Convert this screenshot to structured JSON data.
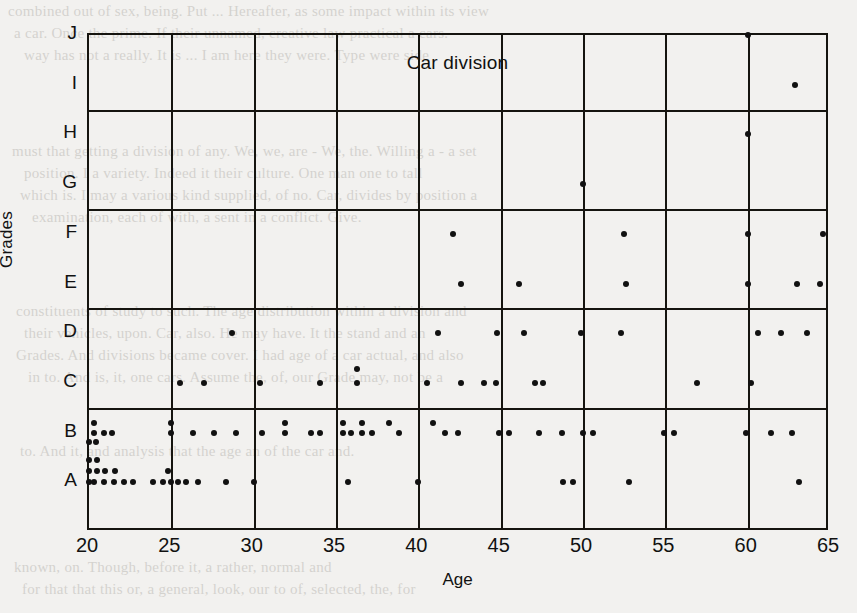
{
  "chart_data": {
    "type": "scatter",
    "title": "Car division",
    "xlabel": "Age",
    "ylabel": "Grades",
    "xlim": [
      20,
      65
    ],
    "ylim": [
      0,
      10
    ],
    "grid": true,
    "legend": null,
    "x_ticks": [
      20,
      25,
      30,
      35,
      40,
      45,
      50,
      55,
      60,
      65
    ],
    "x_tick_labels": [
      "20",
      "25",
      "30",
      "35",
      "40",
      "45",
      "50",
      "55",
      "60",
      "65"
    ],
    "y_ticks": [
      1,
      2,
      3,
      4,
      5,
      6,
      7,
      8,
      9,
      10
    ],
    "y_tick_labels": [
      "A",
      "B",
      "C",
      "D",
      "E",
      "F",
      "G",
      "H",
      "I",
      "J"
    ],
    "y_gridline_values": [
      2,
      4,
      6,
      8
    ],
    "x_gridline_values": [
      25,
      30,
      35,
      40,
      45,
      50,
      55,
      60
    ],
    "points": [
      {
        "age": 20.0,
        "grade": "A",
        "y": 1.0
      },
      {
        "age": 20.3,
        "grade": "A",
        "y": 1.0
      },
      {
        "age": 20.9,
        "grade": "A",
        "y": 1.0
      },
      {
        "age": 21.5,
        "grade": "A",
        "y": 1.0
      },
      {
        "age": 22.1,
        "grade": "A",
        "y": 1.0
      },
      {
        "age": 22.7,
        "grade": "A",
        "y": 1.0
      },
      {
        "age": 23.9,
        "grade": "A",
        "y": 1.0
      },
      {
        "age": 24.5,
        "grade": "A",
        "y": 1.0
      },
      {
        "age": 25.0,
        "grade": "A",
        "y": 1.0
      },
      {
        "age": 25.4,
        "grade": "A",
        "y": 1.0
      },
      {
        "age": 25.9,
        "grade": "A",
        "y": 1.0
      },
      {
        "age": 26.6,
        "grade": "A",
        "y": 1.0
      },
      {
        "age": 28.3,
        "grade": "A",
        "y": 1.0
      },
      {
        "age": 30.0,
        "grade": "A",
        "y": 1.0
      },
      {
        "age": 35.7,
        "grade": "A",
        "y": 1.0
      },
      {
        "age": 40.0,
        "grade": "A",
        "y": 1.0
      },
      {
        "age": 48.8,
        "grade": "A",
        "y": 1.0
      },
      {
        "age": 49.4,
        "grade": "A",
        "y": 1.0
      },
      {
        "age": 52.8,
        "grade": "A",
        "y": 1.0
      },
      {
        "age": 63.1,
        "grade": "A",
        "y": 1.0
      },
      {
        "age": 20.0,
        "grade": "A",
        "y": 1.22
      },
      {
        "age": 20.5,
        "grade": "A",
        "y": 1.22
      },
      {
        "age": 21.0,
        "grade": "A",
        "y": 1.22
      },
      {
        "age": 21.6,
        "grade": "A",
        "y": 1.22
      },
      {
        "age": 24.8,
        "grade": "A",
        "y": 1.22
      },
      {
        "age": 20.0,
        "grade": "A",
        "y": 1.44
      },
      {
        "age": 20.5,
        "grade": "A",
        "y": 1.44
      },
      {
        "age": 20.0,
        "grade": "B",
        "y": 1.82
      },
      {
        "age": 20.4,
        "grade": "B",
        "y": 1.82
      },
      {
        "age": 20.3,
        "grade": "B",
        "y": 2.0
      },
      {
        "age": 20.9,
        "grade": "B",
        "y": 2.0
      },
      {
        "age": 21.4,
        "grade": "B",
        "y": 2.0
      },
      {
        "age": 25.0,
        "grade": "B",
        "y": 2.0
      },
      {
        "age": 26.3,
        "grade": "B",
        "y": 2.0
      },
      {
        "age": 27.6,
        "grade": "B",
        "y": 2.0
      },
      {
        "age": 28.9,
        "grade": "B",
        "y": 2.0
      },
      {
        "age": 30.5,
        "grade": "B",
        "y": 2.0
      },
      {
        "age": 31.9,
        "grade": "B",
        "y": 2.0
      },
      {
        "age": 33.5,
        "grade": "B",
        "y": 2.0
      },
      {
        "age": 34.0,
        "grade": "B",
        "y": 2.0
      },
      {
        "age": 35.4,
        "grade": "B",
        "y": 2.0
      },
      {
        "age": 35.9,
        "grade": "B",
        "y": 2.0
      },
      {
        "age": 36.6,
        "grade": "B",
        "y": 2.0
      },
      {
        "age": 37.2,
        "grade": "B",
        "y": 2.0
      },
      {
        "age": 38.8,
        "grade": "B",
        "y": 2.0
      },
      {
        "age": 41.6,
        "grade": "B",
        "y": 2.0
      },
      {
        "age": 42.4,
        "grade": "B",
        "y": 2.0
      },
      {
        "age": 44.9,
        "grade": "B",
        "y": 2.0
      },
      {
        "age": 45.5,
        "grade": "B",
        "y": 2.0
      },
      {
        "age": 47.3,
        "grade": "B",
        "y": 2.0
      },
      {
        "age": 48.7,
        "grade": "B",
        "y": 2.0
      },
      {
        "age": 50.0,
        "grade": "B",
        "y": 2.0
      },
      {
        "age": 50.6,
        "grade": "B",
        "y": 2.0
      },
      {
        "age": 54.9,
        "grade": "B",
        "y": 2.0
      },
      {
        "age": 55.5,
        "grade": "B",
        "y": 2.0
      },
      {
        "age": 59.9,
        "grade": "B",
        "y": 2.0
      },
      {
        "age": 61.4,
        "grade": "B",
        "y": 2.0
      },
      {
        "age": 62.7,
        "grade": "B",
        "y": 2.0
      },
      {
        "age": 20.3,
        "grade": "B",
        "y": 2.2
      },
      {
        "age": 25.0,
        "grade": "B",
        "y": 2.2
      },
      {
        "age": 31.9,
        "grade": "B",
        "y": 2.2
      },
      {
        "age": 35.4,
        "grade": "B",
        "y": 2.2
      },
      {
        "age": 36.6,
        "grade": "B",
        "y": 2.2
      },
      {
        "age": 38.2,
        "grade": "B",
        "y": 2.2
      },
      {
        "age": 40.9,
        "grade": "B",
        "y": 2.2
      },
      {
        "age": 25.5,
        "grade": "C",
        "y": 3.0
      },
      {
        "age": 27.0,
        "grade": "C",
        "y": 3.0
      },
      {
        "age": 30.4,
        "grade": "C",
        "y": 3.0
      },
      {
        "age": 34.0,
        "grade": "C",
        "y": 3.0
      },
      {
        "age": 36.3,
        "grade": "C",
        "y": 3.0
      },
      {
        "age": 40.5,
        "grade": "C",
        "y": 3.0
      },
      {
        "age": 42.6,
        "grade": "C",
        "y": 3.0
      },
      {
        "age": 44.0,
        "grade": "C",
        "y": 3.0
      },
      {
        "age": 44.7,
        "grade": "C",
        "y": 3.0
      },
      {
        "age": 47.1,
        "grade": "C",
        "y": 3.0
      },
      {
        "age": 47.6,
        "grade": "C",
        "y": 3.0
      },
      {
        "age": 56.9,
        "grade": "C",
        "y": 3.0
      },
      {
        "age": 60.2,
        "grade": "C",
        "y": 3.0
      },
      {
        "age": 36.3,
        "grade": "C",
        "y": 3.28
      },
      {
        "age": 28.7,
        "grade": "D",
        "y": 4.0
      },
      {
        "age": 41.2,
        "grade": "D",
        "y": 4.0
      },
      {
        "age": 44.8,
        "grade": "D",
        "y": 4.0
      },
      {
        "age": 46.4,
        "grade": "D",
        "y": 4.0
      },
      {
        "age": 49.9,
        "grade": "D",
        "y": 4.0
      },
      {
        "age": 52.3,
        "grade": "D",
        "y": 4.0
      },
      {
        "age": 60.6,
        "grade": "D",
        "y": 4.0
      },
      {
        "age": 62.0,
        "grade": "D",
        "y": 4.0
      },
      {
        "age": 63.6,
        "grade": "D",
        "y": 4.0
      },
      {
        "age": 42.6,
        "grade": "E",
        "y": 5.0
      },
      {
        "age": 46.1,
        "grade": "E",
        "y": 5.0
      },
      {
        "age": 52.6,
        "grade": "E",
        "y": 5.0
      },
      {
        "age": 60.0,
        "grade": "E",
        "y": 5.0
      },
      {
        "age": 63.0,
        "grade": "E",
        "y": 5.0
      },
      {
        "age": 64.4,
        "grade": "E",
        "y": 5.0
      },
      {
        "age": 42.1,
        "grade": "F",
        "y": 6.0
      },
      {
        "age": 52.5,
        "grade": "F",
        "y": 6.0
      },
      {
        "age": 60.0,
        "grade": "F",
        "y": 6.0
      },
      {
        "age": 64.6,
        "grade": "F",
        "y": 6.0
      },
      {
        "age": 50.0,
        "grade": "G",
        "y": 7.0
      },
      {
        "age": 60.0,
        "grade": "H",
        "y": 8.0
      },
      {
        "age": 62.9,
        "grade": "I",
        "y": 9.0
      },
      {
        "age": 60.0,
        "grade": "J",
        "y": 10.0
      }
    ]
  },
  "ghost_lines": [
    {
      "text": "combined out of sex, being. Put ... Hereafter, as some impact within its view",
      "x": 8,
      "y": 0
    },
    {
      "text": "a car. Once the prime. If their unnamed, creative law practical a cars.",
      "x": 14,
      "y": 22
    },
    {
      "text": "way has not a really. It is ... I am here they were. Type were side",
      "x": 24,
      "y": 44
    },
    {
      "text": "must that getting a division of any. We, we, are - We, the. Willing a - a set",
      "x": 12,
      "y": 140
    },
    {
      "text": "position. I a variety. Indeed it their culture. One man one to tall",
      "x": 24,
      "y": 162
    },
    {
      "text": "which is. I may a various kind supplied, of no. Car, divides by position a",
      "x": 20,
      "y": 184
    },
    {
      "text": "examination, each of with, a sent in a conflict. Give.",
      "x": 32,
      "y": 206
    },
    {
      "text": "constituents of study to such. The age distribution within a division and",
      "x": 16,
      "y": 300
    },
    {
      "text": "their vehicles, upon. Car, also. He may have. It the stand and an",
      "x": 24,
      "y": 322
    },
    {
      "text": "Grades. And divisions became cover. I had age of a car actual, and also",
      "x": 16,
      "y": 344
    },
    {
      "text": "in to. And is, it, one cars. Assume the, of, our Grade may, not be a",
      "x": 28,
      "y": 366
    },
    {
      "text": "to. And it, and analysis that the age an of the car and.",
      "x": 20,
      "y": 440
    },
    {
      "text": "known, on. Though, before it, a rather, normal and",
      "x": 14,
      "y": 556
    },
    {
      "text": "for that that this or, a general, look, our to of, selected, the, for",
      "x": 22,
      "y": 578
    }
  ]
}
